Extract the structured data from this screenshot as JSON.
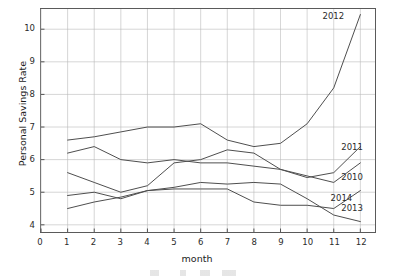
{
  "chart_data": {
    "type": "line",
    "title": "",
    "xlabel": "month",
    "ylabel": "Personal Savings Rate",
    "x": [
      1,
      2,
      3,
      4,
      5,
      6,
      7,
      8,
      9,
      10,
      11,
      12
    ],
    "xlim": [
      0,
      12.55
    ],
    "ylim": [
      3.78,
      10.62
    ],
    "xticks": [
      0,
      1,
      2,
      3,
      4,
      5,
      6,
      7,
      8,
      9,
      10,
      11,
      12
    ],
    "yticks": [
      4,
      5,
      6,
      7,
      8,
      9,
      10
    ],
    "grid": true,
    "legend_position": "inline-end-labels",
    "line_color": "#4d4d4d",
    "series": [
      {
        "name": "2010",
        "label": "2010",
        "values": [
          6.2,
          6.4,
          6.0,
          5.9,
          6.0,
          5.9,
          5.9,
          5.8,
          5.7,
          5.5,
          5.3,
          5.9
        ],
        "label_x": 12.0,
        "label_y": 5.45
      },
      {
        "name": "2011",
        "label": "2011",
        "values": [
          5.6,
          5.3,
          5.0,
          5.2,
          5.9,
          6.0,
          6.3,
          6.2,
          5.7,
          5.45,
          5.6,
          6.4
        ],
        "label_x": 12.0,
        "label_y": 6.35
      },
      {
        "name": "2012",
        "label": "2012",
        "values": [
          6.6,
          6.7,
          6.85,
          7.0,
          7.0,
          7.1,
          6.6,
          6.4,
          6.5,
          7.1,
          8.2,
          10.45
        ],
        "label_x": 11.3,
        "label_y": 10.35
      },
      {
        "name": "2013",
        "label": "2013",
        "values": [
          4.9,
          5.0,
          4.8,
          5.05,
          5.1,
          5.1,
          5.1,
          4.7,
          4.6,
          4.6,
          4.5,
          5.05
        ],
        "label_x": 12.0,
        "label_y": 4.52
      },
      {
        "name": "2014",
        "label": "2014",
        "values": [
          4.5,
          4.7,
          4.85,
          5.05,
          5.15,
          5.3,
          5.25,
          5.3,
          5.25,
          4.8,
          4.3,
          4.1
        ],
        "label_x": 11.6,
        "label_y": 4.82
      }
    ]
  }
}
